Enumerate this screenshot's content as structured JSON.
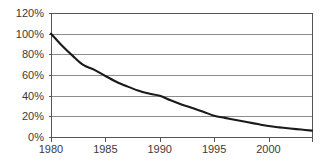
{
  "chart_data": {
    "type": "line",
    "title": "",
    "subtitle": "",
    "xlabel": "",
    "ylabel": "",
    "xlim": [
      1980,
      2004
    ],
    "ylim": [
      0,
      120
    ],
    "grid": true,
    "legend": "none",
    "x_tick_labels": [
      "1980",
      "1985",
      "1990",
      "1995",
      "2000"
    ],
    "x_tick_values": [
      1980,
      1985,
      1990,
      1995,
      2000
    ],
    "y_tick_labels": [
      "0%",
      "20%",
      "40%",
      "60%",
      "80%",
      "100%",
      "120%"
    ],
    "y_tick_values": [
      0,
      20,
      40,
      60,
      80,
      100,
      120
    ],
    "series": [
      {
        "name": "decay",
        "color": "#1a1a1a",
        "x": [
          1980,
          1981,
          1982,
          1983,
          1984,
          1985,
          1986,
          1987,
          1988,
          1989,
          1990,
          1991,
          1992,
          1993,
          1994,
          1995,
          1996,
          1997,
          1998,
          1999,
          2000,
          2001,
          2002,
          2003,
          2004
        ],
        "values": [
          100,
          88.6,
          78.5,
          69.5,
          65.0,
          59.0,
          53.5,
          49.0,
          45.0,
          42.0,
          40.0,
          35.5,
          31.5,
          28.0,
          24.5,
          20.5,
          18.5,
          16.5,
          14.5,
          12.5,
          10.6,
          9.3,
          8.2,
          7.2,
          6.2
        ]
      }
    ]
  },
  "style": {
    "background": "#ffffff",
    "grid_color": "#8c8c8c",
    "frame_color": "#555555",
    "text_color": "#3a3a3a",
    "line_color": "#1a1a1a"
  },
  "geometry": {
    "plot_left": 51,
    "plot_right": 312,
    "plot_top": 13,
    "plot_bottom": 137
  }
}
